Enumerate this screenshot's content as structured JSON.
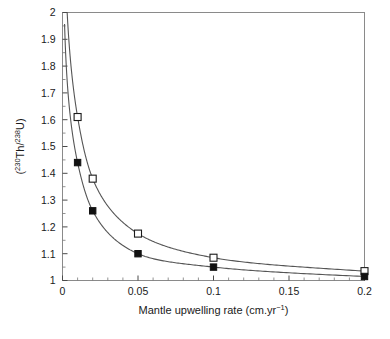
{
  "chart_data": {
    "type": "line",
    "title": "",
    "xlabel": "Mantle upwelling rate (cm.yr⁻¹)",
    "ylabel": "(²³⁰Th/²³⁸U)",
    "ylabel_parts": {
      "open_paren": "(",
      "sup1": "230",
      "el1": "Th/",
      "sup2": "238",
      "el2": "U)"
    },
    "xlabel_parts": {
      "main": "Mantle upwelling rate (cm.yr",
      "sup": "−1",
      "tail": ")"
    },
    "xlim": [
      0,
      0.2
    ],
    "ylim": [
      1,
      2
    ],
    "grid": false,
    "legend": "none",
    "x_ticks": [
      0,
      0.05,
      0.1,
      0.15,
      0.2
    ],
    "x_ticklabels": [
      "0",
      "0.05",
      "0.1",
      "0.15",
      "0.2"
    ],
    "x_minor_ticks": [
      0.01,
      0.02,
      0.03,
      0.04,
      0.06,
      0.07,
      0.08,
      0.09,
      0.11,
      0.12,
      0.13,
      0.14,
      0.16,
      0.17,
      0.18,
      0.19
    ],
    "y_ticks": [
      1,
      1.1,
      1.2,
      1.3,
      1.4,
      1.5,
      1.6,
      1.7,
      1.8,
      1.9,
      2
    ],
    "y_ticklabels": [
      "1",
      "1.1",
      "1.2",
      "1.3",
      "1.4",
      "1.5",
      "1.6",
      "1.7",
      "1.8",
      "1.9",
      "2"
    ],
    "y_minor_ticks": [
      1.05,
      1.15,
      1.25,
      1.35,
      1.45,
      1.55,
      1.65,
      1.75,
      1.85,
      1.95
    ],
    "series": [
      {
        "name": "open-square-series",
        "marker": "open-square",
        "x": [
          0.01,
          0.02,
          0.05,
          0.1,
          0.2
        ],
        "values": [
          1.61,
          1.38,
          1.175,
          1.085,
          1.035
        ]
      },
      {
        "name": "filled-square-series",
        "marker": "filled-square",
        "x": [
          0.01,
          0.02,
          0.05,
          0.1,
          0.2
        ],
        "values": [
          1.44,
          1.26,
          1.1,
          1.05,
          1.015
        ]
      }
    ]
  },
  "figure": {
    "caption_fragment": ""
  }
}
